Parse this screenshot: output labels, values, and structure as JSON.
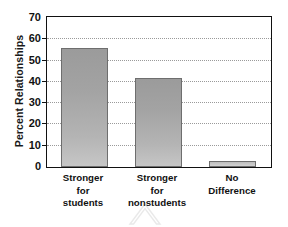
{
  "chart_data": {
    "type": "bar",
    "title": "",
    "xlabel": "",
    "ylabel": "Percent Relationships",
    "categories": [
      "Stronger for students",
      "Stronger for nonstudents",
      "No Difference"
    ],
    "category_lines": [
      [
        "Stronger",
        "for",
        "students"
      ],
      [
        "Stronger",
        "for",
        "nonstudents"
      ],
      [
        "No",
        "Difference"
      ]
    ],
    "values": [
      56,
      42,
      3
    ],
    "ylim": [
      0,
      70
    ],
    "yticks": [
      0,
      10,
      20,
      30,
      40,
      50,
      60,
      70
    ],
    "ytick_labels": [
      "0",
      "10",
      "20",
      "30",
      "40",
      "50",
      "60",
      "70"
    ],
    "grid": true,
    "grid_axis": "y",
    "grid_style": "dotted",
    "legend": false,
    "legend_position": "none",
    "bar_color": "#a8a8a8",
    "bar_edge_color": "#6e6e6e",
    "frame_color": "#111111",
    "grid_color": "#9a9a9a",
    "background": "#ffffff"
  },
  "watermark": {
    "icon": "chevron-up-watermark"
  }
}
